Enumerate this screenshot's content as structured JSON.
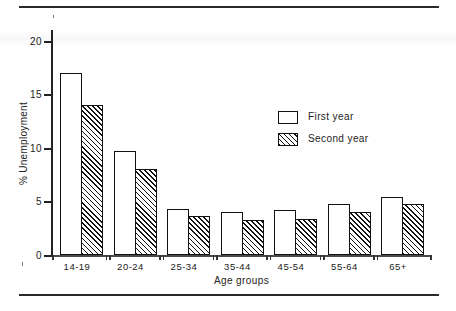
{
  "figure": {
    "kind": "grouped-bar-chart",
    "ylabel": "% Unemployment",
    "xlabel": "Age groups",
    "ytick_labels": [
      "0",
      "5",
      "10",
      "15",
      "20"
    ],
    "legend": {
      "first_label": "First year",
      "second_label": "Second year",
      "first_swatch": "empty-box-swatch",
      "second_swatch": "hatched-box-swatch"
    },
    "colors": {
      "ink": "#111111",
      "axis": "#222222",
      "background": "#ffffff"
    }
  },
  "chart_data": {
    "type": "bar",
    "title": "",
    "xlabel": "Age groups",
    "ylabel": "% Unemployment",
    "ylim": [
      0,
      21
    ],
    "yticks": [
      0,
      5,
      10,
      15,
      20
    ],
    "grid": false,
    "legend_position": "inside-upper-right",
    "categories": [
      "14-19",
      "20-24",
      "25-34",
      "35-44",
      "45-54",
      "55-64",
      "65+"
    ],
    "series": [
      {
        "name": "First year",
        "fill": "white",
        "values": [
          17.0,
          9.7,
          4.3,
          4.0,
          4.2,
          4.8,
          5.4
        ]
      },
      {
        "name": "Second year",
        "fill": "hatched",
        "values": [
          14.0,
          8.0,
          3.6,
          3.3,
          3.4,
          4.0,
          4.8
        ]
      }
    ]
  }
}
